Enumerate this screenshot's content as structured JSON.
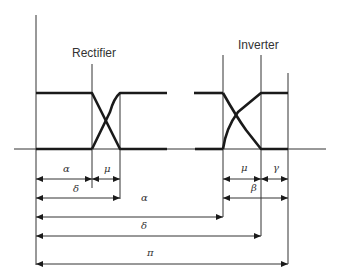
{
  "diagram": {
    "title_labels": {
      "rectifier": "Rectifier",
      "inverter": "Inverter"
    },
    "colors": {
      "line": "#333333",
      "waveform": "#1a1a1a",
      "background": "#ffffff"
    },
    "geometry": {
      "axis_y": 149,
      "axis_x_start": 14,
      "axis_x_end": 326,
      "upper_level_y": 93,
      "verticals": [
        {
          "name": "origin-line",
          "x": 36,
          "y1": 15,
          "y2": 265
        },
        {
          "name": "rectifier-alpha-line",
          "x": 92,
          "y1": 64,
          "y2": 188
        },
        {
          "name": "rectifier-delta-line",
          "x": 120,
          "y1": 93,
          "y2": 199
        },
        {
          "name": "inverter-alpha-line",
          "x": 223,
          "y1": 55,
          "y2": 217
        },
        {
          "name": "inverter-delta-line",
          "x": 261,
          "y1": 55,
          "y2": 236
        },
        {
          "name": "inverter-pi-line",
          "x": 288,
          "y1": 73,
          "y2": 264
        }
      ]
    },
    "dimensions": [
      {
        "name": "rect-alpha-dim",
        "label": "α",
        "x1": 36,
        "x2": 92,
        "y": 179,
        "label_x": 63,
        "label_y": 172,
        "both_ends": true
      },
      {
        "name": "rect-mu-dim",
        "label": "μ",
        "x1": 92,
        "x2": 120,
        "y": 179,
        "label_x": 104,
        "label_y": 172,
        "both_ends": true
      },
      {
        "name": "rect-delta-dim",
        "label": "δ",
        "x1": 36,
        "x2": 120,
        "y": 198,
        "label_x": 73,
        "label_y": 192,
        "both_ends": true
      },
      {
        "name": "inv-mu-dim",
        "label": "μ",
        "x1": 223,
        "x2": 261,
        "y": 179,
        "label_x": 241,
        "label_y": 171,
        "both_ends": true
      },
      {
        "name": "inv-gamma-dim",
        "label": "γ",
        "x1": 261,
        "x2": 288,
        "y": 179,
        "label_x": 273,
        "label_y": 171,
        "both_ends": true
      },
      {
        "name": "inv-beta-dim",
        "label": "β",
        "x1": 223,
        "x2": 288,
        "y": 198,
        "label_x": 251,
        "label_y": 191,
        "both_ends": true
      },
      {
        "name": "inv-alpha-dim",
        "label": "α",
        "x1": 36,
        "x2": 223,
        "y": 217,
        "label_x": 141,
        "label_y": 201,
        "both_ends": true
      },
      {
        "name": "inv-delta-dim",
        "label": "δ",
        "x1": 36,
        "x2": 261,
        "y": 236,
        "label_x": 141,
        "label_y": 229,
        "both_ends": true
      },
      {
        "name": "pi-dim",
        "label": "π",
        "x1": 36,
        "x2": 288,
        "y": 264,
        "label_x": 147,
        "label_y": 256,
        "both_ends": true
      }
    ]
  }
}
